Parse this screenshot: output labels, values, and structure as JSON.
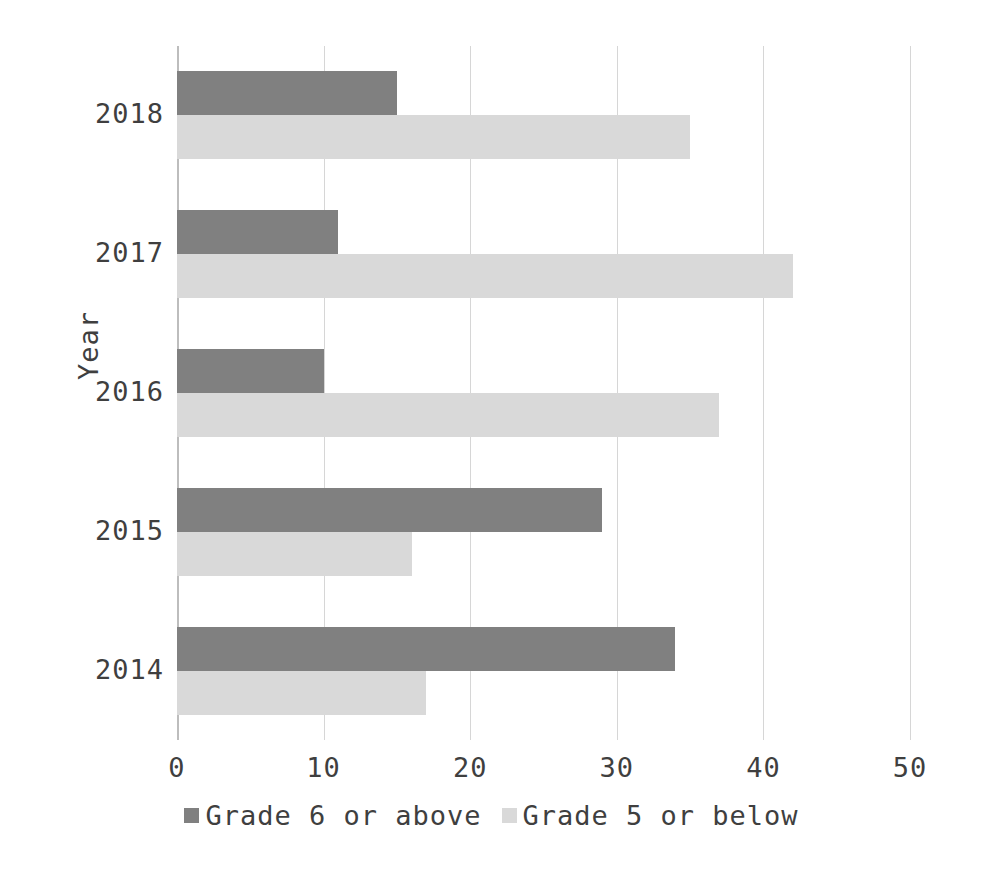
{
  "chart_data": {
    "type": "bar",
    "orientation": "horizontal",
    "title": "",
    "xlabel": "",
    "ylabel": "Year",
    "categories": [
      "2018",
      "2017",
      "2016",
      "2015",
      "2014"
    ],
    "series": [
      {
        "name": "Grade 6 or above",
        "color": "#808080",
        "values": [
          15,
          11,
          10,
          29,
          34
        ]
      },
      {
        "name": "Grade 5 or below",
        "color": "#d9d9d9",
        "values": [
          35,
          42,
          37,
          16,
          17
        ]
      }
    ],
    "xlim": [
      0,
      50
    ],
    "xticks": [
      0,
      10,
      20,
      30,
      40,
      50
    ],
    "xtick_labels": [
      "0",
      "10",
      "20",
      "30",
      "40",
      "50"
    ],
    "grid": true,
    "grid_axis": "x",
    "legend_position": "bottom",
    "legend": [
      "Grade 6 or above",
      "Grade 5 or below"
    ]
  },
  "axes": {
    "y_title": "Year"
  },
  "colors": {
    "series_dark": "#808080",
    "series_light": "#d9d9d9",
    "gridline": "#d6d6d6",
    "text": "#3f3f3f",
    "background": "#ffffff"
  }
}
